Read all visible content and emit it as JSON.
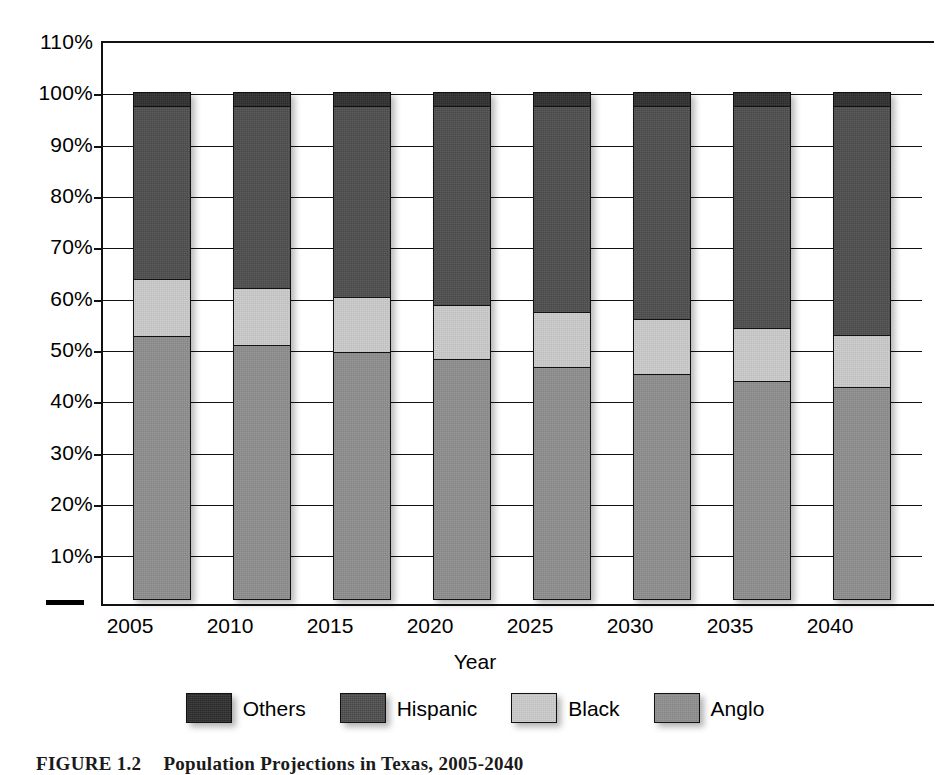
{
  "chart_data": {
    "type": "bar",
    "subtype": "100% stacked column",
    "title": "",
    "xlabel": "Year",
    "ylabel": "",
    "categories": [
      "2005",
      "2010",
      "2015",
      "2020",
      "2025",
      "2030",
      "2035",
      "2040"
    ],
    "ylim": [
      0,
      110
    ],
    "yticks": [
      10,
      20,
      30,
      40,
      50,
      60,
      70,
      80,
      90,
      100,
      110
    ],
    "ytick_labels": [
      "10%",
      "20%",
      "30%",
      "40%",
      "50%",
      "60%",
      "70%",
      "80%",
      "90%",
      "100%",
      "110%"
    ],
    "grid": true,
    "legend_position": "bottom",
    "stack_order_bottom_to_top": [
      "Anglo",
      "Black",
      "Hispanic",
      "Others"
    ],
    "series": [
      {
        "name": "Anglo",
        "color": "#8f8f8f",
        "values": [
          51.5,
          49.8,
          48.4,
          47.0,
          45.4,
          44.1,
          42.8,
          41.5
        ]
      },
      {
        "name": "Black",
        "color": "#cccccc",
        "values": [
          11.5,
          11.4,
          11.1,
          10.8,
          11.2,
          11.0,
          10.7,
          10.6
        ]
      },
      {
        "name": "Hispanic",
        "color": "#4e4e4e",
        "values": [
          34.0,
          35.8,
          37.5,
          39.2,
          40.4,
          41.9,
          43.5,
          44.9
        ]
      },
      {
        "name": "Others",
        "color": "#2e2e2e",
        "values": [
          3.0,
          3.0,
          3.0,
          3.0,
          3.0,
          3.0,
          3.0,
          3.0
        ]
      }
    ],
    "cumulative_tops_percent": {
      "2005": {
        "Anglo": 51.5,
        "Black": 63.0,
        "Hispanic": 97.0,
        "Others": 100.0
      },
      "2010": {
        "Anglo": 49.8,
        "Black": 61.2,
        "Hispanic": 97.0,
        "Others": 100.0
      },
      "2015": {
        "Anglo": 48.4,
        "Black": 59.5,
        "Hispanic": 97.0,
        "Others": 100.0
      },
      "2020": {
        "Anglo": 47.0,
        "Black": 57.8,
        "Hispanic": 97.0,
        "Others": 100.0
      },
      "2025": {
        "Anglo": 45.4,
        "Black": 56.6,
        "Hispanic": 97.0,
        "Others": 100.0
      },
      "2030": {
        "Anglo": 44.1,
        "Black": 55.1,
        "Hispanic": 97.0,
        "Others": 100.0
      },
      "2035": {
        "Anglo": 42.8,
        "Black": 53.5,
        "Hispanic": 97.0,
        "Others": 100.0
      },
      "2040": {
        "Anglo": 41.5,
        "Black": 52.1,
        "Hispanic": 97.0,
        "Others": 100.0
      }
    }
  },
  "axes": {
    "y_tick_labels": [
      "110%",
      "100%",
      "90%",
      "80%",
      "70%",
      "60%",
      "50%",
      "40%",
      "30%",
      "20%",
      "10%"
    ],
    "x_tick_labels": [
      "2005",
      "2010",
      "2015",
      "2020",
      "2025",
      "2030",
      "2035",
      "2040"
    ],
    "x_axis_title": "Year"
  },
  "legend": {
    "items": [
      {
        "label": "Others",
        "color": "#2e2e2e"
      },
      {
        "label": "Hispanic",
        "color": "#4e4e4e"
      },
      {
        "label": "Black",
        "color": "#cccccc"
      },
      {
        "label": "Anglo",
        "color": "#8f8f8f"
      }
    ]
  },
  "caption": {
    "figure_number": "FIGURE 1.2",
    "text": "Population Projections in Texas, 2005-2040"
  }
}
